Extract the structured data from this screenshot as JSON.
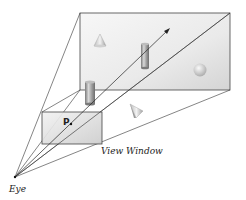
{
  "diagram": {
    "labels": {
      "point": "P",
      "view_window": "View Window",
      "eye": "Eye"
    },
    "colors": {
      "line": "#333333",
      "plane_fill_light": "#f4f4f4",
      "plane_fill_dark": "#d6d6d6",
      "window_fill_light": "#f0f0f0",
      "window_fill_dark": "#cfcfcf",
      "object_light": "#e6e6e6",
      "object_dark": "#8a8a8a"
    },
    "objects": [
      {
        "type": "cone",
        "position": "far-plane upper-left"
      },
      {
        "type": "cylinder",
        "position": "far-plane center, intersected by ray"
      },
      {
        "type": "sphere",
        "position": "far-plane right"
      },
      {
        "type": "cylinder",
        "position": "near lower-left"
      },
      {
        "type": "cone",
        "position": "near center, tilted"
      }
    ]
  }
}
